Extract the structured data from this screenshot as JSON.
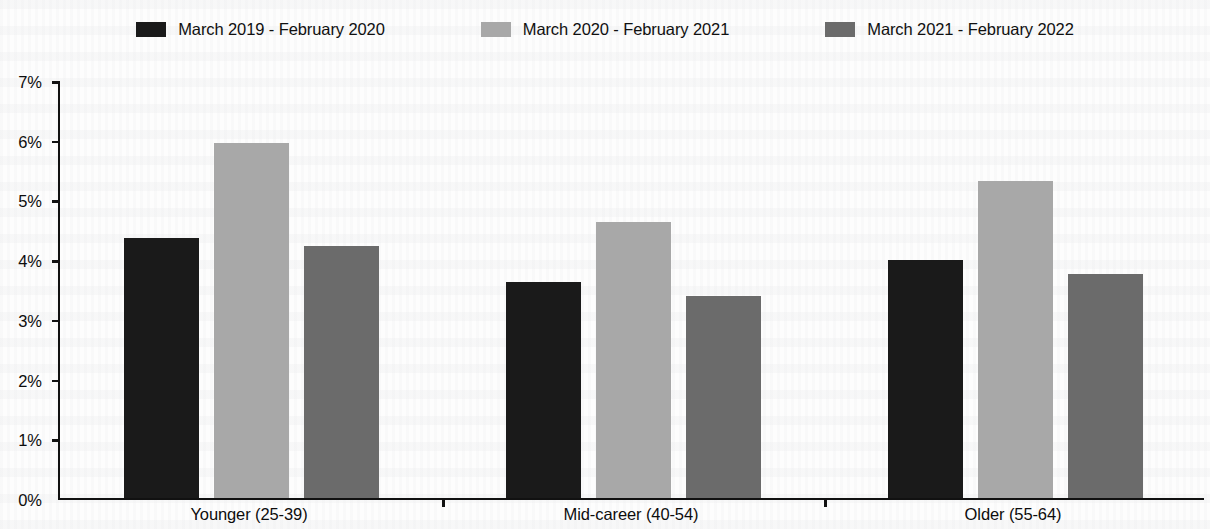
{
  "chart_data": {
    "type": "bar",
    "title": "",
    "subtitle": "",
    "xlabel": "",
    "ylabel": "",
    "ylim": [
      0,
      7
    ],
    "y_tick_labels": [
      "0%",
      "1%",
      "2%",
      "3%",
      "4%",
      "5%",
      "6%",
      "7%"
    ],
    "y_tick_values": [
      0,
      1,
      2,
      3,
      4,
      5,
      6,
      7
    ],
    "y_unit": "%",
    "grid": false,
    "legend_position": "top-center",
    "categories": [
      "Younger (25-39)",
      "Mid-career (40-54)",
      "Older (55-64)"
    ],
    "series": [
      {
        "name": "March 2019 - February 2020",
        "color": "#1a1a1a",
        "values": [
          4.35,
          3.62,
          3.99
        ]
      },
      {
        "name": "March 2020 - February 2021",
        "color": "#a8a8a8",
        "values": [
          5.95,
          4.62,
          5.31
        ]
      },
      {
        "name": "March 2021 - February 2022",
        "color": "#6b6b6b",
        "values": [
          4.22,
          3.38,
          3.75
        ]
      }
    ]
  }
}
